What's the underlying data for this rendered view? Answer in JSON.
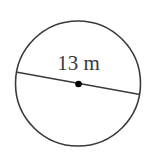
{
  "diagram": {
    "type": "circle-with-diameter",
    "label": "13 m",
    "measurement": {
      "value": 13,
      "unit": "m",
      "quantity": "diameter"
    },
    "colors": {
      "background": "#ffffff",
      "stroke": "#3a3a3a",
      "center_dot": "#000000",
      "label": "#3a3a3a"
    }
  }
}
